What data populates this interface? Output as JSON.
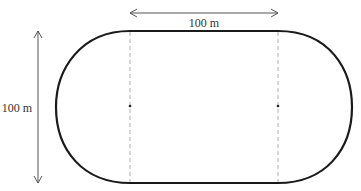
{
  "diagram": {
    "type": "running-track-stadium-shape",
    "labels": {
      "width": "100 m",
      "height": "100 m"
    },
    "colors": {
      "track": "#1a1a1a",
      "arrows": "#555555",
      "dashed": "#888888",
      "text": "#333333",
      "background": "#ffffff"
    }
  }
}
